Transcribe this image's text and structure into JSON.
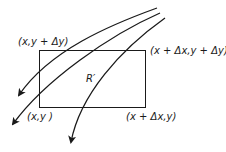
{
  "diagram": {
    "region_label": "R′",
    "corners": {
      "top_left": "(x,y + Δy)",
      "top_right": "(x + Δx,y + Δy)",
      "bottom_left": "(x,y )",
      "bottom_right": "(x + Δx,y)"
    },
    "curves": [
      {
        "name": "flow-curve-1",
        "direction": "arrow pointing down-left"
      },
      {
        "name": "flow-curve-2",
        "direction": "arrow pointing down-left"
      },
      {
        "name": "flow-curve-3",
        "direction": "arrow pointing down"
      }
    ],
    "colors": {
      "line": "#1a1a1a",
      "background": "#ffffff"
    }
  }
}
